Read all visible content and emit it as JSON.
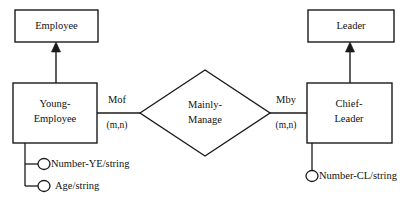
{
  "diagram": {
    "type": "entity-relationship-diagram",
    "background_color": "#ffffff",
    "stroke_color": "#1a1a1a",
    "text_color": "#111111",
    "entities": [
      {
        "id": "employee",
        "label": "Employee",
        "label_line1": "Employee",
        "label_line2": ""
      },
      {
        "id": "young_employee",
        "label": "Young-Employee",
        "label_line1": "Young-",
        "label_line2": "Employee"
      },
      {
        "id": "leader",
        "label": "Leader",
        "label_line1": "Leader",
        "label_line2": ""
      },
      {
        "id": "chief_leader",
        "label": "Chief-Leader",
        "label_line1": "Chief-",
        "label_line2": "Leader"
      }
    ],
    "relationship": {
      "id": "mainly_manage",
      "label": "Mainly-Manage",
      "label_line1": "Mainly-",
      "label_line2": "Manage"
    },
    "roles": [
      {
        "id": "mof",
        "label": "Mof",
        "cardinality": "(m,n)",
        "side": "left"
      },
      {
        "id": "mby",
        "label": "Mby",
        "cardinality": "(m,n)",
        "side": "right"
      }
    ],
    "attributes": [
      {
        "id": "number_ye",
        "label": "Number-YE/string",
        "owner": "young_employee"
      },
      {
        "id": "age",
        "label": "Age/string",
        "owner": "young_employee"
      },
      {
        "id": "number_cl",
        "label": "Number-CL/string",
        "owner": "chief_leader"
      }
    ],
    "generalizations": [
      {
        "id": "isa_employee",
        "child": "young_employee",
        "parent": "employee"
      },
      {
        "id": "isa_leader",
        "child": "chief_leader",
        "parent": "leader"
      }
    ]
  }
}
